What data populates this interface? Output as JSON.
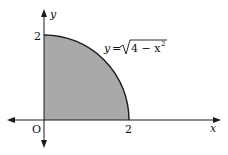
{
  "diagram": {
    "type": "function-graph",
    "axes": {
      "x_label": "x",
      "y_label": "y",
      "origin_label": "O"
    },
    "ticks": {
      "x_tick": "2",
      "y_tick": "2"
    },
    "curve": {
      "equation_lhs": "y",
      "equation_eq": "=",
      "equation_rhs_prefix": "4 − x",
      "equation_exponent": "2",
      "description": "y = sqrt(4 - x^2), quarter circle of radius 2 in the first quadrant"
    },
    "region": {
      "description": "Shaded region under the curve between x = 0 and x = 2",
      "fill_color": "#a9a9a9"
    },
    "colors": {
      "axis": "#1a1a1a",
      "curve": "#1a1a1a",
      "shade": "#a9a9a9"
    }
  }
}
